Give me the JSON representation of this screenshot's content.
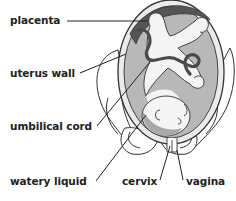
{
  "diagram": {
    "labels": [
      {
        "id": "placenta",
        "text": "placenta"
      },
      {
        "id": "uterus-wall",
        "text": "uterus wall"
      },
      {
        "id": "umbilical-cord",
        "text": "umbilical cord"
      },
      {
        "id": "watery-liquid",
        "text": "watery liquid"
      },
      {
        "id": "cervix",
        "text": "cervix"
      },
      {
        "id": "vagina",
        "text": "vagina"
      }
    ],
    "colors": {
      "background": "#ffffff",
      "outline": "#333333",
      "uterus_fill": "#ebebeb",
      "amniotic_fluid": "#b8b8b8",
      "placenta": "#555555",
      "cord": "#4a4a4a",
      "fetus_skin": "#f4f4f4",
      "fetus_shadow": "#a9a9a9",
      "pelvis": "#ffffff",
      "text": "#222222"
    }
  }
}
